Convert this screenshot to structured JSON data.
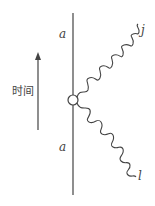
{
  "diagram": {
    "time_label": "时间",
    "line_labels": {
      "top": "a",
      "bottom": "a"
    },
    "wave_labels": {
      "upper": "j",
      "lower": "l"
    },
    "colors": {
      "stroke": "#444444",
      "background": "#ffffff"
    }
  }
}
